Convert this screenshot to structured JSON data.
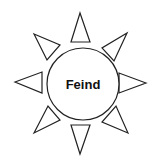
{
  "diagram": {
    "center": {
      "label": "Feind",
      "shape": "circle"
    },
    "rays": [
      {
        "id": "top",
        "direction": "up"
      },
      {
        "id": "top-right",
        "direction": "up-right"
      },
      {
        "id": "right",
        "direction": "right"
      },
      {
        "id": "bottom-right",
        "direction": "down-right"
      },
      {
        "id": "bottom",
        "direction": "down"
      },
      {
        "id": "bottom-left",
        "direction": "down-left"
      },
      {
        "id": "left",
        "direction": "left"
      },
      {
        "id": "top-left",
        "direction": "up-left"
      }
    ],
    "colors": {
      "stroke": "#222222",
      "fill": "#ffffff",
      "text": "#111111"
    }
  }
}
